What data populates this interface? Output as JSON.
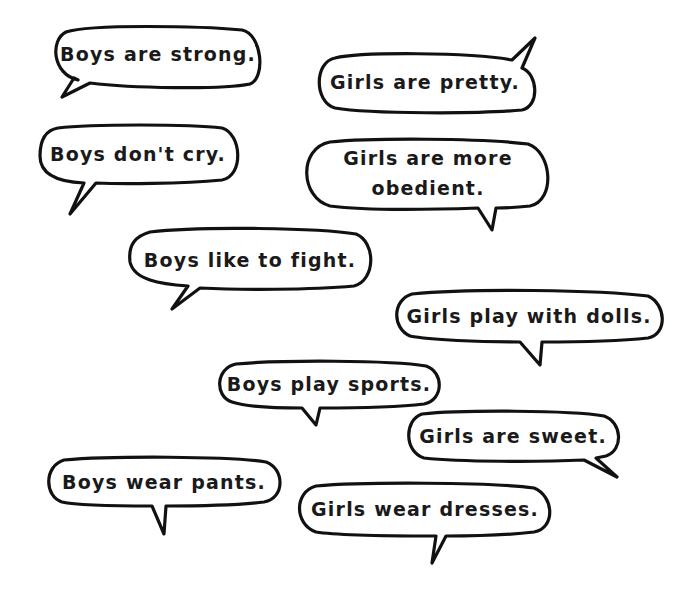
{
  "colors": {
    "background": "#ffffff",
    "stroke": "#111111",
    "text": "#1a1a1a"
  },
  "bubbles": [
    {
      "id": "boys-strong",
      "text": "Boys are strong."
    },
    {
      "id": "girls-pretty",
      "text": "Girls are pretty."
    },
    {
      "id": "boys-cry",
      "text": "Boys don't cry."
    },
    {
      "id": "girls-obedient",
      "line1": "Girls are more",
      "line2": "obedient."
    },
    {
      "id": "boys-fight",
      "text": "Boys like to fight."
    },
    {
      "id": "girls-dolls",
      "text": "Girls play with dolls."
    },
    {
      "id": "boys-sports",
      "text": "Boys play sports."
    },
    {
      "id": "girls-sweet",
      "text": "Girls are sweet."
    },
    {
      "id": "boys-pants",
      "text": "Boys wear pants."
    },
    {
      "id": "girls-dresses",
      "text": "Girls wear dresses."
    }
  ]
}
